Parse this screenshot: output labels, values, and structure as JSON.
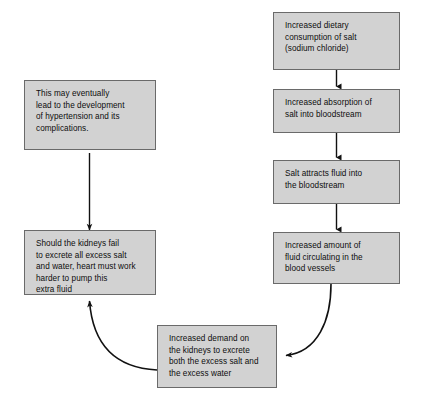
{
  "diagram": {
    "background_color": "#ffffff",
    "node_fill_color": "#d2d2d2",
    "node_border_color": "#6a6a6a",
    "connector_color": "#111111",
    "nodes": [
      {
        "id": "salt-intake",
        "text": "Increased dietary\nconsumption of salt\n(sodium chloride)"
      },
      {
        "id": "absorption",
        "text": "Increased absorption of\nsalt into bloodstream"
      },
      {
        "id": "attract-fluid",
        "text": "Salt attracts fluid into\nthe bloodstream"
      },
      {
        "id": "fluid-amount",
        "text": "Increased amount of\nfluid circulating in the\nblood vessels"
      },
      {
        "id": "kidney-demand",
        "text": "Increased demand on\nthe kidneys to excrete\nboth the excess salt and\nthe excess water"
      },
      {
        "id": "heart-work",
        "text": "Should the kidneys fail\nto excrete all excess salt\nand water, heart must work\nharder to pump this\nextra fluid"
      },
      {
        "id": "hypertension",
        "text": "This may eventually\nlead to the development\nof hypertension and its\ncomplications."
      }
    ],
    "connectors": [
      {
        "id": "salt-intake-to-absorption",
        "kind": "straight-arrow-down"
      },
      {
        "id": "absorption-to-attract-fluid",
        "kind": "straight-arrow-down"
      },
      {
        "id": "attract-fluid-to-fluid-amount",
        "kind": "straight-arrow-down"
      },
      {
        "id": "fluid-amount-to-kidney-demand",
        "kind": "curved-arrow-left"
      },
      {
        "id": "kidney-demand-to-heart-work",
        "kind": "curved-arrow-up-left"
      },
      {
        "id": "heart-work-to-hypertension",
        "kind": "straight-arrow-up"
      }
    ]
  }
}
